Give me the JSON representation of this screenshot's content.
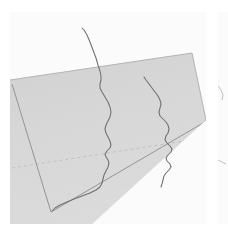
{
  "figure": {
    "title": "",
    "background_color": "#ffffff",
    "panel_background_color": "#fbfbfb",
    "width_px": 228,
    "height_px": 233
  },
  "panels": [
    {
      "name": "main-perspective-panel",
      "x": 10,
      "y": 12,
      "width": 196,
      "height": 212
    },
    {
      "name": "adjacent-panel-peek",
      "x": 218,
      "y": 12,
      "width": 10,
      "height": 212
    }
  ],
  "colors": {
    "plane_fill": "#d8d8d8",
    "plane_fill_upper": "#cfcfcf",
    "plane_edge": "#9a9a9a",
    "inner_box_edge": "#8c8c8c",
    "grid_dashed": "#c0c0c0",
    "curve_stroke": "#6f6f6f",
    "curve_stroke_dark": "#5a5a5a",
    "panel_background": "#fbfbfb"
  },
  "chart_data": {
    "type": "line",
    "title": "",
    "subtitle": "",
    "xlabel": "",
    "ylabel": "",
    "zlabel": "",
    "projection": "3d-perspective",
    "grid": true,
    "legend_position": "none",
    "tick_labels": {
      "x": [],
      "y": [],
      "z": []
    },
    "annotations": [],
    "surface": {
      "name": "base-plane",
      "description": "light gray quadrilateral floor plane in perspective",
      "corners_px": [
        [
          0,
          68
        ],
        [
          182,
          41
        ],
        [
          196,
          108
        ],
        [
          82,
          212
        ]
      ],
      "fill": "#d8d8d8"
    },
    "inner_box": {
      "name": "inner-boundary-rectangle",
      "description": "darker outline rectangle inset on the plane",
      "corners_px": [
        [
          2,
          72
        ],
        [
          178,
          45
        ],
        [
          193,
          111
        ],
        [
          41,
          200
        ]
      ]
    },
    "grid_lines": [
      {
        "name": "dashed-horizontal-gridline",
        "style": "dashed",
        "from_px": [
          2,
          156
        ],
        "to_px": [
          193,
          126
        ]
      }
    ],
    "series": [
      {
        "name": "trace-left",
        "color": "#6f6f6f",
        "points_px": [
          [
            72,
            16
          ],
          [
            74,
            18
          ],
          [
            77,
            23
          ],
          [
            80,
            30
          ],
          [
            83,
            38
          ],
          [
            86,
            46
          ],
          [
            88,
            53
          ],
          [
            90,
            59
          ],
          [
            91,
            64
          ],
          [
            91,
            68
          ],
          [
            90,
            72
          ],
          [
            90,
            76
          ],
          [
            92,
            80
          ],
          [
            95,
            85
          ],
          [
            98,
            90
          ],
          [
            100,
            95
          ],
          [
            101,
            100
          ],
          [
            100,
            105
          ],
          [
            98,
            109
          ],
          [
            96,
            113
          ],
          [
            95,
            117
          ],
          [
            96,
            121
          ],
          [
            98,
            125
          ],
          [
            100,
            129
          ],
          [
            101,
            133
          ],
          [
            100,
            136
          ],
          [
            97,
            139
          ],
          [
            95,
            142
          ],
          [
            96,
            145
          ],
          [
            98,
            148
          ],
          [
            99,
            151
          ],
          [
            98,
            155
          ],
          [
            96,
            159
          ],
          [
            94,
            163
          ],
          [
            93,
            167
          ],
          [
            92,
            171
          ],
          [
            90,
            175
          ],
          [
            86,
            178
          ],
          [
            80,
            181
          ],
          [
            72,
            184
          ],
          [
            64,
            187
          ],
          [
            57,
            190
          ],
          [
            50,
            193
          ],
          [
            45,
            196
          ],
          [
            42,
            199
          ]
        ]
      },
      {
        "name": "trace-right",
        "color": "#6f6f6f",
        "points_px": [
          [
            134,
            65
          ],
          [
            136,
            68
          ],
          [
            139,
            72
          ],
          [
            142,
            76
          ],
          [
            145,
            80
          ],
          [
            148,
            84
          ],
          [
            150,
            88
          ],
          [
            151,
            92
          ],
          [
            150,
            96
          ],
          [
            149,
            100
          ],
          [
            150,
            104
          ],
          [
            153,
            107
          ],
          [
            156,
            110
          ],
          [
            158,
            113
          ],
          [
            159,
            117
          ],
          [
            158,
            121
          ],
          [
            156,
            124
          ],
          [
            155,
            128
          ],
          [
            157,
            131
          ],
          [
            160,
            134
          ],
          [
            162,
            137
          ],
          [
            161,
            140
          ],
          [
            158,
            143
          ],
          [
            156,
            146
          ],
          [
            157,
            149
          ],
          [
            160,
            152
          ],
          [
            161,
            155
          ],
          [
            159,
            158
          ],
          [
            156,
            161
          ],
          [
            154,
            164
          ],
          [
            153,
            168
          ],
          [
            152,
            172
          ],
          [
            151,
            175
          ]
        ]
      }
    ],
    "peek_panel_marks": [
      {
        "name": "peek-curve-fragment-upper",
        "points_px": [
          [
            0,
            74
          ],
          [
            3,
            78
          ],
          [
            5,
            83
          ],
          [
            4,
            88
          ]
        ]
      },
      {
        "name": "peek-curve-fragment-lower",
        "points_px": [
          [
            0,
            148
          ],
          [
            4,
            150
          ],
          [
            8,
            152
          ]
        ]
      }
    ]
  },
  "accessibility": {
    "figure_description": "Two wiggly vertical traces plotted on a gray plane rendered in 3D perspective, with a faint dashed gridline and an inset boundary rectangle."
  }
}
